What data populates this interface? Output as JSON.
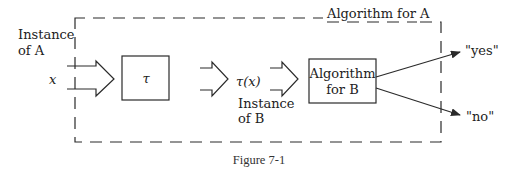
{
  "figure": {
    "caption": "Figure 7-1",
    "outer_box_label": "Algorithm for A",
    "input_label_line1": "Instance",
    "input_label_line2": "of A",
    "input_symbol": "x",
    "transform_box_label": "τ",
    "transformed_symbol": "τ(x)",
    "intermediate_label_line1": "Instance",
    "intermediate_label_line2": "of B",
    "inner_box_label_line1": "Algorithm",
    "inner_box_label_line2": "for B",
    "output_yes": "\"yes\"",
    "output_no": "\"no\""
  },
  "colors": {
    "stroke": "#2a2a2a",
    "text": "#222222",
    "background": "#ffffff"
  }
}
